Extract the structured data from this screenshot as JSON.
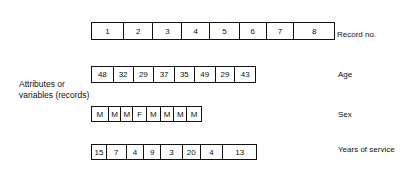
{
  "side_label": {
    "line1": "Attributes or",
    "line2": "variables (records)"
  },
  "rows": [
    {
      "name": "record-no",
      "label": "Record no.",
      "values": [
        "1",
        "2",
        "3",
        "4",
        "5",
        "6",
        "7",
        "8"
      ],
      "edges": [
        91,
        123,
        153,
        182,
        210,
        240,
        267,
        295,
        335
      ],
      "top": 22,
      "bottom": 40,
      "label_x": 337,
      "label_y": 30
    },
    {
      "name": "age",
      "label": "Age",
      "values": [
        "48",
        "32",
        "29",
        "37",
        "35",
        "49",
        "29",
        "43"
      ],
      "edges": [
        91,
        113,
        133,
        154,
        175,
        195,
        216,
        236,
        256
      ],
      "top": 66,
      "bottom": 83,
      "label_x": 338,
      "label_y": 70
    },
    {
      "name": "sex",
      "label": "Sex",
      "values": [
        "M",
        "M",
        "M",
        "F",
        "M",
        "M",
        "M",
        "M"
      ],
      "edges": [
        91,
        108,
        121,
        133,
        147,
        161,
        175,
        188,
        202
      ],
      "top": 106,
      "bottom": 122,
      "label_x": 338,
      "label_y": 110
    },
    {
      "name": "years-of-service",
      "label": "Years of service",
      "values": [
        "15",
        "7",
        "4",
        "9",
        "3",
        "20",
        "4",
        "13"
      ],
      "edges": [
        91,
        106,
        126,
        144,
        161,
        183,
        201,
        224,
        257
      ],
      "top": 144,
      "bottom": 160,
      "label_x": 338,
      "label_y": 145
    }
  ]
}
